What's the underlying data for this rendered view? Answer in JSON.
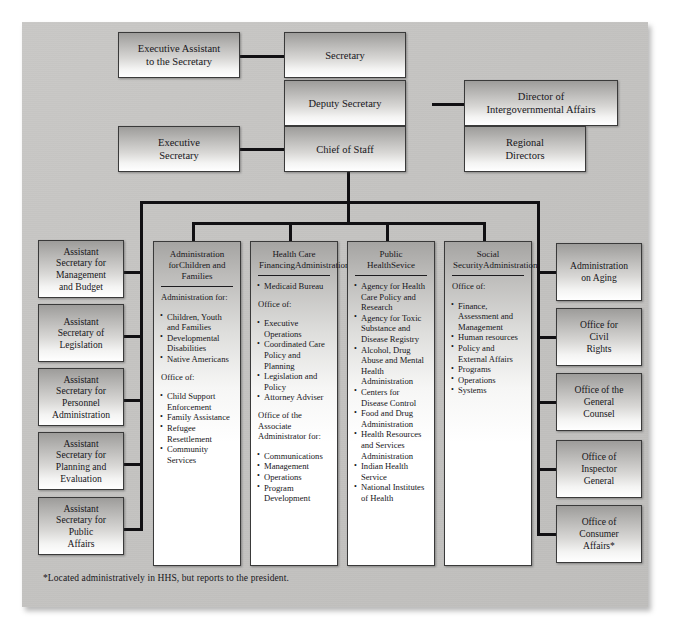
{
  "chart": {
    "footnote": "*Located administratively in HHS, but reports to the president.",
    "colors": {
      "panel_bg": "#c4c3c1",
      "box_border": "#3a3a3a",
      "connector": "#111013",
      "text": "#17161a",
      "page_bg": "#ffffff"
    }
  },
  "top_nodes": {
    "executive_assistant": {
      "line1": "Executive Assistant",
      "line2": "to the Secretary"
    },
    "secretary": {
      "line1": "Secretary"
    },
    "deputy_secretary": {
      "line1": "Deputy Secretary"
    },
    "director_intergov": {
      "line1": "Director of",
      "line2": "Intergovernmental Affairs"
    },
    "executive_secretary": {
      "line1": "Executive",
      "line2": "Secretary"
    },
    "chief_of_staff": {
      "line1": "Chief of Staff"
    },
    "regional_directors": {
      "line1": "Regional",
      "line2": "Directors"
    }
  },
  "left_column": [
    {
      "lines": [
        "Assistant",
        "Secretary for",
        "Management",
        "and Budget"
      ]
    },
    {
      "lines": [
        "Assistant",
        "Secretary of",
        "Legislation"
      ]
    },
    {
      "lines": [
        "Assistant",
        "Secretary for",
        "Personnel",
        "Administration"
      ]
    },
    {
      "lines": [
        "Assistant",
        "Secretary for",
        "Planning and",
        "Evaluation"
      ]
    },
    {
      "lines": [
        "Assistant",
        "Secretary for",
        "Public",
        "Affairs"
      ]
    }
  ],
  "right_column": [
    {
      "lines": [
        "Administration",
        "on Aging"
      ]
    },
    {
      "lines": [
        "Office for",
        "Civil",
        "Rights"
      ]
    },
    {
      "lines": [
        "Office of the",
        "General",
        "Counsel"
      ]
    },
    {
      "lines": [
        "Office of",
        "Inspector",
        "General"
      ]
    },
    {
      "lines": [
        "Office of",
        "Consumer",
        "Affairs*"
      ]
    }
  ],
  "columns": [
    {
      "title_line1": "Administration for",
      "title_line2": "Children and Families",
      "groups": [
        {
          "heading": "Administration for:",
          "items": [
            "Children, Youth and Families",
            "Developmental Disabilities",
            "Native Americans"
          ]
        },
        {
          "heading": "Office of:",
          "items": [
            "Child Support Enforcement",
            "Family Assistance",
            "Refugee Resettlement",
            "Community Services"
          ]
        }
      ]
    },
    {
      "title_line1": "Health Care Financing",
      "title_line2": "Administration",
      "groups": [
        {
          "heading": "",
          "items": [
            "Medicaid Bureau"
          ]
        },
        {
          "heading": "Office of:",
          "items": [
            "Executive Operations",
            "Coordinated Care Policy and Planning",
            "Legislation and Policy",
            "Attorney Adviser"
          ]
        },
        {
          "heading": "Office of the Associate Administrator for:",
          "items": [
            "Communications",
            "Management",
            "Operations",
            "Program Development"
          ]
        }
      ]
    },
    {
      "title_line1": "Public Health",
      "title_line2": "Sevice",
      "groups": [
        {
          "heading": "",
          "items": [
            "Agency for Health Care Policy and Research",
            "Agency for Toxic Substance and Disease Registry",
            "Alcohol, Drug Abuse and Mental Health Administration",
            "Centers for Disease Control",
            "Food and Drug Administration",
            "Health Resources and Services Administration",
            "Indian Health Service",
            "National Institutes of Health"
          ]
        }
      ]
    },
    {
      "title_line1": "Social Security",
      "title_line2": "Administration",
      "groups": [
        {
          "heading": "Office of:",
          "items": [
            "Finance, Assessment and Management",
            "Human resources",
            "Policy and External Affairs",
            "Programs",
            "Operations",
            "Systems"
          ]
        }
      ]
    }
  ]
}
